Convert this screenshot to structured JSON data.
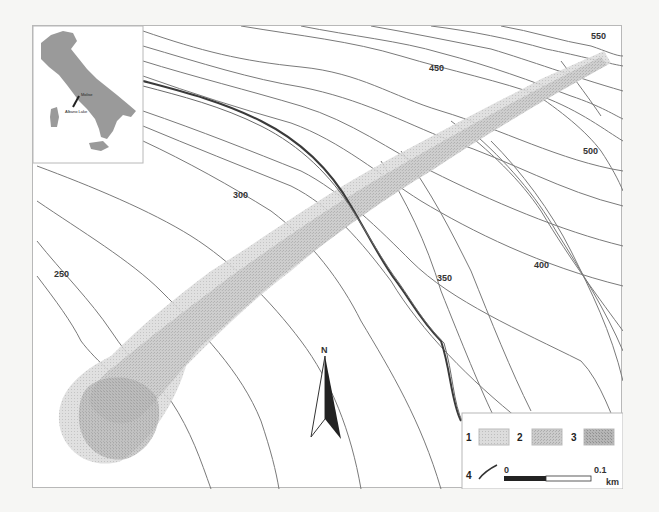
{
  "map": {
    "contour_labels": [
      {
        "text": "550",
        "x": 600,
        "y": 38
      },
      {
        "text": "450",
        "x": 438,
        "y": 70
      },
      {
        "text": "500",
        "x": 590,
        "y": 153
      },
      {
        "text": "300",
        "x": 232,
        "y": 197
      },
      {
        "text": "350",
        "x": 443,
        "y": 281
      },
      {
        "text": "400",
        "x": 537,
        "y": 267
      },
      {
        "text": "250",
        "x": 60,
        "y": 275
      }
    ],
    "inset": {
      "country": "Italy",
      "site_label": "Molise",
      "lake_label": "Albano Lake"
    },
    "north_arrow": {
      "label": "N"
    },
    "legend": {
      "items": [
        {
          "num": "1",
          "pattern": "light-stipple"
        },
        {
          "num": "2",
          "pattern": "medium-stipple"
        },
        {
          "num": "3",
          "pattern": "dark-stipple"
        },
        {
          "num": "4",
          "pattern": "stream-line"
        }
      ],
      "scale": {
        "start": "0",
        "end": "0.1",
        "unit": "km"
      }
    },
    "colors": {
      "background": "#ffffff",
      "contour": "#7a7a7a",
      "zone_light": "#d6d6d6",
      "zone_medium": "#c2c2c2",
      "zone_dark": "#a8a8a8",
      "stream": "#3a3a3a"
    }
  }
}
